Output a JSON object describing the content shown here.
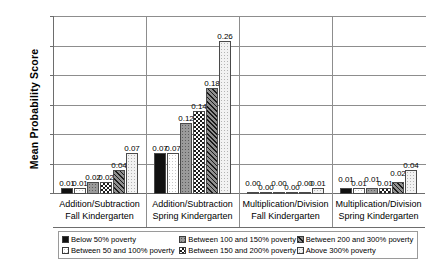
{
  "chart_data": {
    "type": "bar",
    "title": "",
    "xlabel": "",
    "ylabel": "Mean Probability Score",
    "ylim": [
      0,
      0.3
    ],
    "yticks": [
      "0.00",
      "0.05",
      "0.10",
      "0.15",
      "0.20",
      "0.25",
      "0.30"
    ],
    "grid": true,
    "legend_position": "bottom",
    "categories": [
      {
        "line1": "Addition/Subtraction",
        "line2": "Fall Kindergarten"
      },
      {
        "line1": "Addition/Subtraction",
        "line2": "Spring Kindergarten"
      },
      {
        "line1": "Multiplication/Division",
        "line2": "Fall Kindergarten"
      },
      {
        "line1": "Multiplication/Division",
        "line2": "Spring Kindergarten"
      }
    ],
    "series": [
      {
        "name": "Below 50% poverty",
        "pattern": "solid-black",
        "values": [
          0.01,
          0.07,
          0.0,
          0.01
        ],
        "labels": [
          "0.01",
          "0.07",
          "0.00",
          "0.01"
        ]
      },
      {
        "name": "Between 50 and 100% poverty",
        "pattern": "white-dotted",
        "values": [
          0.01,
          0.07,
          0.0,
          0.01
        ],
        "labels": [
          "0.01",
          "0.07",
          "0.00",
          "0.01"
        ]
      },
      {
        "name": "Between 100 and 150% poverty",
        "pattern": "gray-dotted",
        "values": [
          0.02,
          0.12,
          0.0,
          0.01
        ],
        "labels": [
          "0.02",
          "0.12",
          "0.00",
          "0.01"
        ]
      },
      {
        "name": "Between 150 and 200% poverty",
        "pattern": "checkered",
        "values": [
          0.02,
          0.14,
          0.0,
          0.01
        ],
        "labels": [
          "0.02",
          "0.14",
          "0.00",
          "0.01"
        ]
      },
      {
        "name": "Between 200 and 300% poverty",
        "pattern": "diagonal-hatch",
        "values": [
          0.04,
          0.18,
          0.0,
          0.02
        ],
        "labels": [
          "0.04",
          "0.18",
          "0.00",
          "0.02"
        ]
      },
      {
        "name": "Above 300% poverty",
        "pattern": "light-dotted",
        "values": [
          0.07,
          0.26,
          0.01,
          0.04
        ],
        "labels": [
          "0.07",
          "0.26",
          "0.01",
          "0.04"
        ]
      }
    ]
  },
  "colors": {
    "axis": "#6d6d6d",
    "grid": "#8d8d8d",
    "bar_outline": "#4a4a4a",
    "background": "#ffffff"
  }
}
